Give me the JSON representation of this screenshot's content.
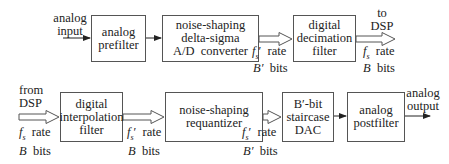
{
  "adc_chain": {
    "input_label": [
      "analog",
      "input"
    ],
    "blocks": [
      {
        "id": "analog-prefilter",
        "lines": [
          "analog",
          "prefilter"
        ]
      },
      {
        "id": "delta-sigma-adc",
        "lines": [
          "noise-shaping",
          "delta-sigma",
          "A/D  converter"
        ]
      },
      {
        "id": "decimation-filter",
        "lines": [
          "digital",
          "decimation",
          "filter"
        ]
      }
    ],
    "link1": {
      "rate": "f_s′ rate",
      "rate_sym": "f",
      "rate_sub": "s",
      "rate_prime": "′",
      "rate_word": "rate",
      "bits_sym": "B′",
      "bits_word": "bits"
    },
    "link2": {
      "rate_sym": "f",
      "rate_sub": "s",
      "rate_prime": "",
      "rate_word": "rate",
      "bits_sym": "B",
      "bits_word": "bits"
    },
    "output_label": [
      "to",
      "DSP"
    ]
  },
  "dac_chain": {
    "input_label": [
      "from",
      "DSP"
    ],
    "link0": {
      "rate_sym": "f",
      "rate_sub": "s",
      "rate_prime": "",
      "rate_word": "rate",
      "bits_sym": "B",
      "bits_word": "bits"
    },
    "blocks": [
      {
        "id": "interpolation-filter",
        "lines": [
          "digital",
          "interpolation",
          "filter"
        ]
      },
      {
        "id": "requantizer",
        "lines": [
          "noise-shaping",
          "requantizer"
        ]
      },
      {
        "id": "staircase-dac",
        "lines": [
          "B′-bit",
          "staircase",
          "DAC"
        ]
      },
      {
        "id": "analog-postfilter",
        "lines": [
          "analog",
          "postfilter"
        ]
      }
    ],
    "link1": {
      "rate_sym": "f",
      "rate_sub": "s",
      "rate_prime": "′",
      "rate_word": "rate",
      "bits_sym": "B",
      "bits_word": "bits"
    },
    "link2": {
      "rate_sym": "f",
      "rate_sub": "s",
      "rate_prime": "′",
      "rate_word": "rate",
      "bits_sym": "B′",
      "bits_word": "bits"
    },
    "output_label": [
      "analog",
      "output"
    ]
  }
}
